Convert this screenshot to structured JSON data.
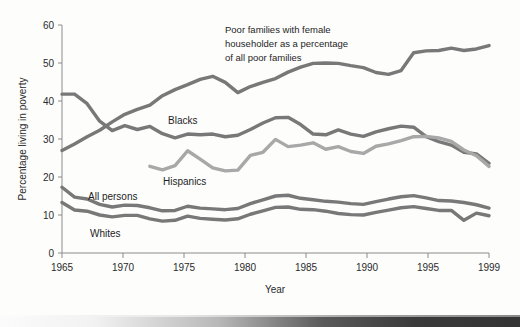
{
  "figure": {
    "background_color": "#fdfdfc",
    "line_color_dark": "#787878",
    "line_color_light": "#a8a8a8",
    "axis_color": "#8c8c8c",
    "text_color": "#1e1e1e"
  },
  "annotation": {
    "line1": "Poor families with female",
    "line2": "householder as a percentage",
    "line3": "of all poor families"
  },
  "labels": {
    "blacks": "Blacks",
    "hispanics": "Hispanics",
    "all_persons": "All persons",
    "whites": "Whites"
  },
  "axes": {
    "xlabel": "Year",
    "ylabel": "Percentage living in poverty",
    "x_ticks": [
      "1965",
      "1970",
      "1975",
      "1980",
      "1985",
      "1990",
      "1995",
      "1999"
    ],
    "y_ticks": [
      "0",
      "10",
      "20",
      "30",
      "40",
      "50",
      "60"
    ]
  },
  "chart_data": {
    "type": "line",
    "title": "",
    "xlabel": "Year",
    "ylabel": "Percentage living in poverty",
    "xlim": [
      1965,
      1999
    ],
    "ylim": [
      0,
      60
    ],
    "x_ticks": [
      1965,
      1970,
      1975,
      1980,
      1985,
      1990,
      1995,
      1999
    ],
    "y_ticks": [
      0,
      10,
      20,
      30,
      40,
      50,
      60
    ],
    "grid": false,
    "legend": "inline-labels",
    "x": [
      1965,
      1966,
      1967,
      1968,
      1969,
      1970,
      1971,
      1972,
      1973,
      1974,
      1975,
      1976,
      1977,
      1978,
      1979,
      1980,
      1981,
      1982,
      1983,
      1984,
      1985,
      1986,
      1987,
      1988,
      1989,
      1990,
      1991,
      1992,
      1993,
      1994,
      1995,
      1996,
      1997,
      1998,
      1999
    ],
    "series": [
      {
        "name": "Poor families with female householder as a percentage of all poor families",
        "color": "#787878",
        "values": [
          27.0,
          28.7,
          30.6,
          32.3,
          34.5,
          36.5,
          37.8,
          38.9,
          41.4,
          43.0,
          44.3,
          45.7,
          46.5,
          44.9,
          42.2,
          43.8,
          44.9,
          45.9,
          47.6,
          48.9,
          49.9,
          50.0,
          49.9,
          49.3,
          48.8,
          47.5,
          47.0,
          48.0,
          52.7,
          53.2,
          53.3,
          53.9,
          53.3,
          53.7,
          54.6
        ]
      },
      {
        "name": "Blacks",
        "color": "#787878",
        "values": [
          41.8,
          41.8,
          39.3,
          34.7,
          32.2,
          33.5,
          32.5,
          33.3,
          31.4,
          30.3,
          31.3,
          31.1,
          31.3,
          30.6,
          31.0,
          32.5,
          34.2,
          35.6,
          35.7,
          33.8,
          31.3,
          31.1,
          32.4,
          31.3,
          30.7,
          31.9,
          32.7,
          33.4,
          33.1,
          30.6,
          29.3,
          28.4,
          26.5,
          26.1,
          23.6
        ]
      },
      {
        "name": "Hispanics",
        "color": "#a8a8a8",
        "values": [
          null,
          null,
          null,
          null,
          null,
          null,
          null,
          22.8,
          21.9,
          23.0,
          26.9,
          24.7,
          22.4,
          21.6,
          21.8,
          25.7,
          26.5,
          29.9,
          28.0,
          28.4,
          29.0,
          27.3,
          28.0,
          26.7,
          26.2,
          28.1,
          28.7,
          29.6,
          30.6,
          30.7,
          30.3,
          29.4,
          27.1,
          25.6,
          22.8
        ]
      },
      {
        "name": "All persons",
        "color": "#787878",
        "values": [
          17.3,
          14.7,
          14.2,
          12.8,
          12.1,
          12.6,
          12.5,
          11.9,
          11.1,
          11.2,
          12.3,
          11.8,
          11.6,
          11.4,
          11.7,
          13.0,
          14.0,
          15.0,
          15.2,
          14.4,
          14.0,
          13.6,
          13.4,
          13.0,
          12.8,
          13.5,
          14.2,
          14.8,
          15.1,
          14.5,
          13.8,
          13.7,
          13.3,
          12.7,
          11.8
        ]
      },
      {
        "name": "Whites",
        "color": "#787878",
        "values": [
          13.3,
          11.3,
          11.0,
          10.0,
          9.5,
          9.9,
          9.9,
          9.0,
          8.4,
          8.6,
          9.7,
          9.1,
          8.9,
          8.7,
          9.0,
          10.2,
          11.1,
          12.0,
          12.1,
          11.5,
          11.4,
          11.0,
          10.4,
          10.1,
          10.0,
          10.7,
          11.3,
          11.9,
          12.2,
          11.7,
          11.2,
          11.2,
          8.6,
          10.5,
          9.8
        ]
      }
    ]
  }
}
